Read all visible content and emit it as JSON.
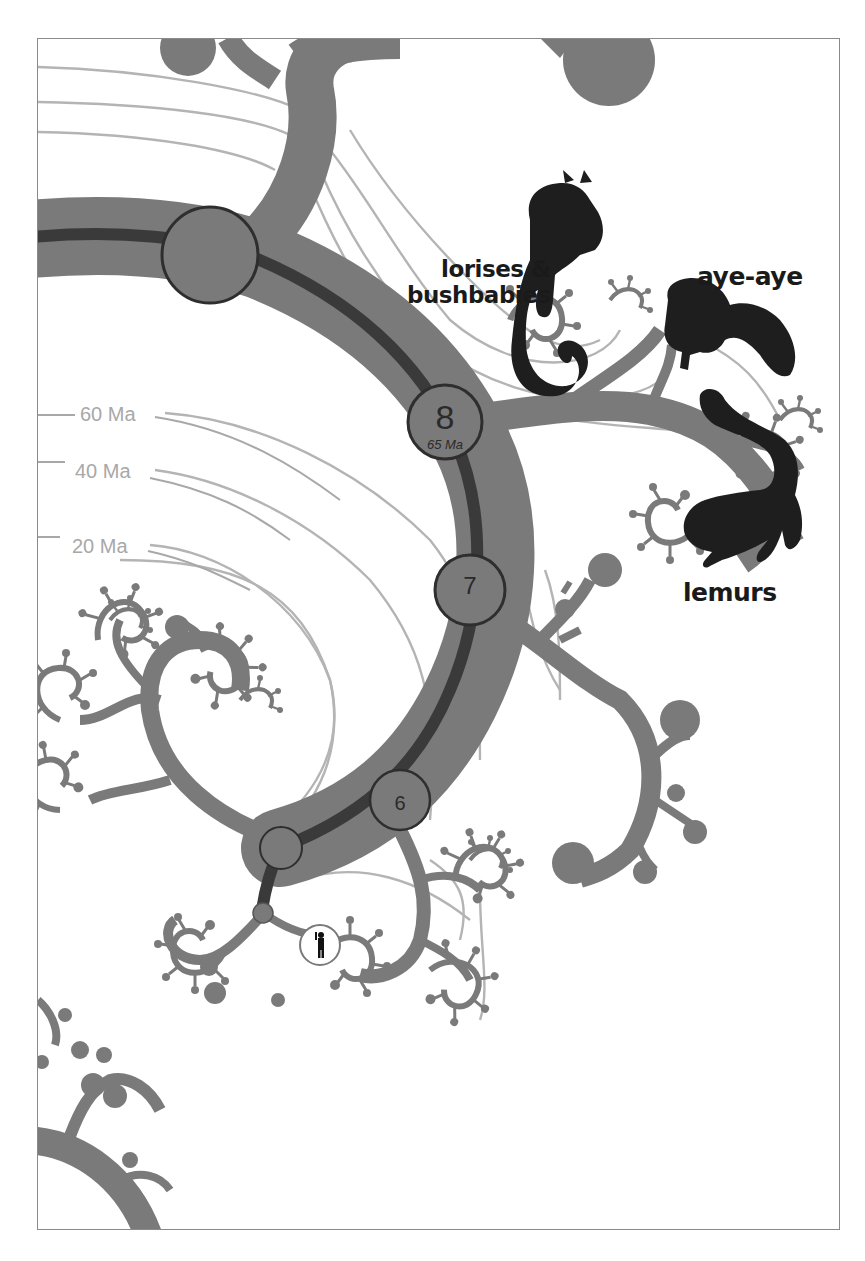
{
  "figure": {
    "type": "phylogenetic-tree",
    "style": "grayscale fractal tree",
    "colors": {
      "branch": "#7a7a7a",
      "lineage_line": "#3a3a3a",
      "node_outline": "#2e2e2e",
      "time_contour": "#b4b4b4",
      "silhouette": "#1e1e1e",
      "frame": "#8a8a8a",
      "background": "#ffffff"
    }
  },
  "labels": {
    "lorises_line1": "lorises &",
    "lorises_line2": "bushbabies",
    "ayeaye": "aye-aye",
    "lemurs": "lemurs"
  },
  "time_scale": {
    "ticks": [
      "60 Ma",
      "40 Ma",
      "20 Ma"
    ]
  },
  "nodes": [
    {
      "id": "9",
      "label": "",
      "sublabel": ""
    },
    {
      "id": "8",
      "label": "8",
      "sublabel": "65 Ma"
    },
    {
      "id": "7",
      "label": "7",
      "sublabel": ""
    },
    {
      "id": "6",
      "label": "6",
      "sublabel": ""
    },
    {
      "id": "5",
      "label": "",
      "sublabel": ""
    },
    {
      "id": "4",
      "label": "",
      "sublabel": ""
    }
  ],
  "silhouettes": [
    "bushbaby-silhouette",
    "aye-aye-silhouette",
    "lemur-silhouette",
    "human-silhouette"
  ]
}
